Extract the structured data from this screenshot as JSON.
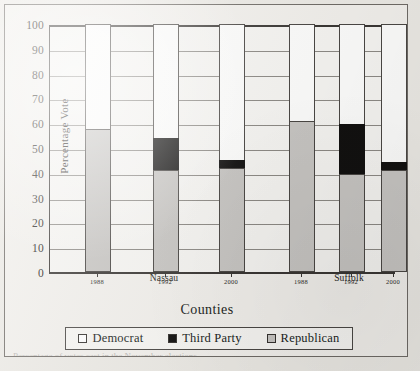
{
  "figure": {
    "y_axis_title": "Percentage Vote",
    "x_axis_title": "Counties",
    "caption_sliver": "Percentage of votes cast in the November elections"
  },
  "legend": {
    "items": [
      {
        "label": "Democrat",
        "swatch": "white-square-icon",
        "color": "#ffffff"
      },
      {
        "label": "Third Party",
        "swatch": "black-square-icon",
        "color": "#121110"
      },
      {
        "label": "Republican",
        "swatch": "gray-square-icon",
        "color": "#c8c6c3"
      }
    ]
  },
  "groups": [
    {
      "label": "Nassau"
    },
    {
      "label": "Suffolk"
    }
  ],
  "chart_data": {
    "type": "bar",
    "stacked": true,
    "title": "",
    "xlabel": "Counties",
    "ylabel": "Percentage Vote",
    "ylim": [
      0,
      100
    ],
    "yticks": [
      0,
      10,
      20,
      30,
      40,
      50,
      60,
      70,
      80,
      90,
      100
    ],
    "ytick_labels": [
      "0",
      "10",
      "20",
      "30",
      "40",
      "50",
      "60",
      "70",
      "80",
      "90",
      "100"
    ],
    "grid": true,
    "legend_position": "bottom",
    "groups": [
      "Nassau",
      "Suffolk"
    ],
    "categories": [
      "1988",
      "1992",
      "2000",
      "1988",
      "1992",
      "2000"
    ],
    "group_of_category": [
      "Nassau",
      "Nassau",
      "Nassau",
      "Suffolk",
      "Suffolk",
      "Suffolk"
    ],
    "series": [
      {
        "name": "Republican",
        "color": "#c8c6c3",
        "values": [
          57.5,
          41.0,
          42.0,
          61.0,
          39.5,
          41.0
        ]
      },
      {
        "name": "Third Party",
        "color": "#121110",
        "values": [
          0.0,
          13.0,
          3.0,
          0.0,
          20.0,
          3.5
        ]
      },
      {
        "name": "Democrat",
        "color": "#ffffff",
        "values": [
          42.5,
          46.0,
          55.0,
          39.0,
          40.5,
          55.5
        ]
      }
    ],
    "cumulative_tops": {
      "Republican": [
        57.5,
        41.0,
        42.0,
        61.0,
        39.5,
        41.0
      ],
      "Third Party": [
        57.5,
        54.0,
        45.0,
        61.0,
        59.5,
        44.5
      ],
      "Democrat": [
        100.0,
        100.0,
        100.0,
        100.0,
        100.0,
        100.0
      ]
    }
  }
}
